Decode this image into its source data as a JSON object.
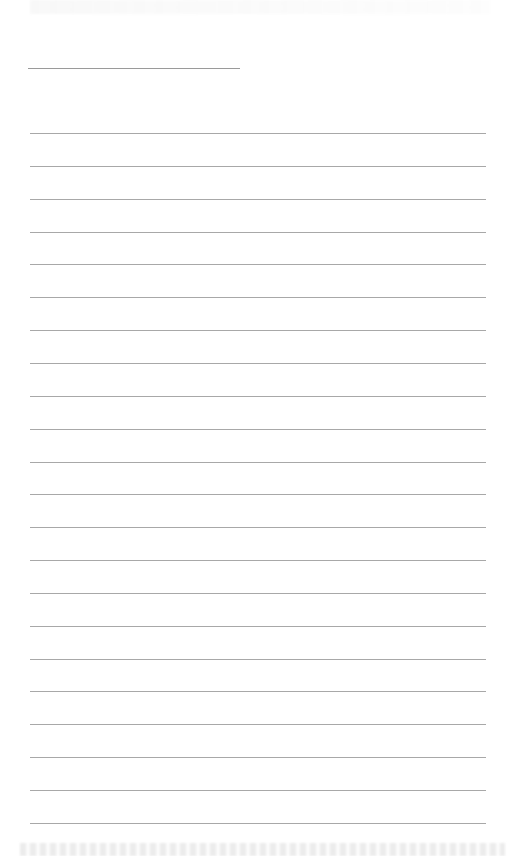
{
  "page": {
    "type": "lined-paper",
    "background": "#ffffff",
    "line_color": "#a8a8a8",
    "header_line": {
      "y": 68,
      "x_start": 28,
      "x_end": 240
    },
    "ruled_lines": {
      "count": 22,
      "first_y": 133,
      "spacing": 32.85,
      "x_start": 30,
      "x_end": 486
    }
  }
}
